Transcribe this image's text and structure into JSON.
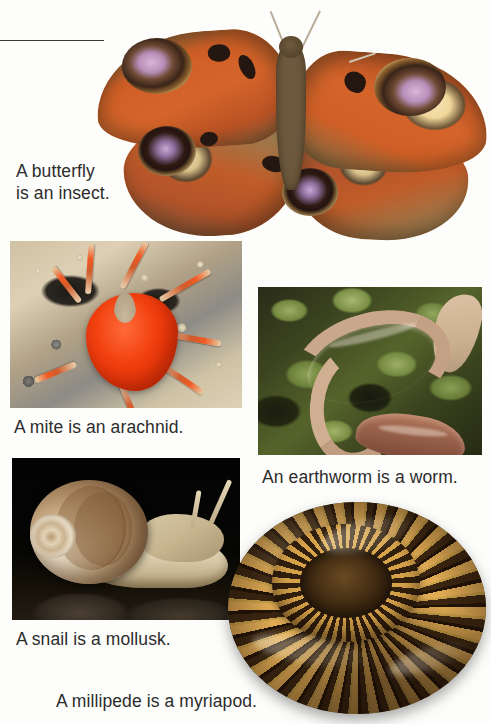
{
  "page": {
    "background_color": "#fdfdfb",
    "text_color": "#2c2c2c",
    "divider": "horizontal-rule"
  },
  "captions": {
    "butterfly": "A butterfly\nis an insect.",
    "mite": "A mite is an arachnid.",
    "earthworm": "An earthworm is a worm.",
    "snail": "A snail is a mollusk.",
    "millipede": "A millipede is a myriapod."
  },
  "figures": [
    {
      "id": "butterfly",
      "subject": "peacock butterfly",
      "group": "insect",
      "style": "cutout",
      "colors": {
        "wing": "#d4642a",
        "border": "#6d5a3c",
        "eyespot_outer": "#f3e0a8",
        "eyespot_inner": "#b78fba",
        "body": "#6d5a3e"
      }
    },
    {
      "id": "mite",
      "subject": "red velvet mite on sand",
      "group": "arachnid",
      "style": "framed-photo",
      "colors": {
        "body": "#f03a18",
        "ground": "#c8bb9e"
      }
    },
    {
      "id": "earthworm",
      "subject": "earthworm on moss",
      "group": "worm",
      "style": "framed-photo",
      "colors": {
        "worm": "#c9a78c",
        "moss": "#55642b",
        "shadow": "#262a14"
      }
    },
    {
      "id": "snail",
      "subject": "garden snail with spiral shell",
      "group": "mollusk",
      "style": "framed-photo",
      "colors": {
        "shell": "#c9ab85",
        "foot": "#e7dcbd",
        "background": "#050505"
      }
    },
    {
      "id": "millipede",
      "subject": "coiled banded millipede",
      "group": "myriapod",
      "style": "cutout",
      "colors": {
        "band_light": "#d8a24a",
        "band_dark": "#2a1a0e"
      }
    }
  ]
}
